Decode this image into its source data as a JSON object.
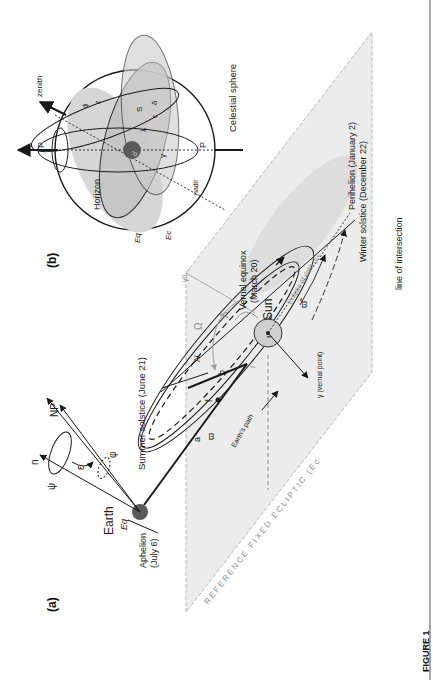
{
  "figure": {
    "caption": "FIGURE 1",
    "orientation": "rotated 90deg counter-clockwise (landscape figure on portrait page)"
  },
  "panel_a": {
    "label": "(a)",
    "plane_label": "REFERENCE FIXED ECLIPTIC (Ec",
    "plane_subscript": "0",
    "plane_close": ")",
    "earth": {
      "name": "Earth",
      "eq_label": "Eq",
      "eq_subscript": "t",
      "aphelion": "Aphelion",
      "aphelion_date": "(July 6)"
    },
    "axes": {
      "n": "n",
      "np": "NP",
      "psi": "ψ",
      "epsilon": "ε",
      "phi": "φ"
    },
    "summer_solstice": "Summer solstice (June 21)",
    "orbit": {
      "a": "a",
      "b": "b",
      "varpi": "ϖ",
      "f1": "f",
      "f1_sub": "1",
      "f2": "f",
      "f2_sub": "2",
      "earths_path": "Earth's path",
      "N": "N",
      "i": "i"
    },
    "sun": {
      "name": "Sun",
      "vernal_equinox": "Vernal equinox",
      "vernal_date": "(March 20)",
      "Omega": "Ω",
      "Lambda": "Λ",
      "gamma0": "γ0",
      "varpi_tilde": "ϖ̃",
      "ecliptic_of_date": "Ecliptic of date (Ec",
      "ecliptic_sub": "t",
      "ecliptic_close": ")"
    },
    "gamma_vernal": "γ (vernal point)",
    "perihelion": "Perihelion (January 2)",
    "winter_solstice": "Winter solstice (December 22)",
    "line_of_intersection": "line of intersection"
  },
  "panel_b": {
    "label": "(b)",
    "title": "Celestial sphere",
    "zenith": "zenith",
    "nadir": "nadir",
    "PN": "P",
    "PN_sub": "N",
    "PS": "P",
    "PS_sub": "S",
    "horizon": "Horizon",
    "Eq": "Eq",
    "Eq_sub": "t",
    "Ec": "Ec",
    "Ec_sub": "t",
    "phi": "ϕ",
    "z": "z",
    "S": "S",
    "delta": "δ",
    "epsilon": "ε",
    "lambda": "λ",
    "gamma": "γ",
    "observer": "o'"
  },
  "colors": {
    "plane_fill": "#ececec",
    "plane_edge": "#b5b5b5",
    "sphere_dark": "#b8b8b8",
    "sphere_light": "#d6d6d6",
    "earth": "#5a5a5a",
    "sun_fill": "#cfcfcf",
    "ink": "#1a1a1a",
    "grey_text": "#8a8a8a"
  }
}
